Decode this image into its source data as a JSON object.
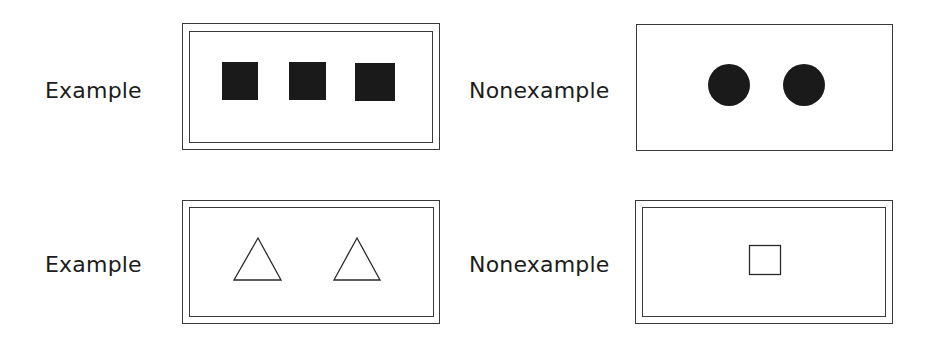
{
  "panels": [
    {
      "id": "top-left",
      "label": "Example",
      "frame_style": "double",
      "shapes": [
        {
          "kind": "filled-square",
          "count": 3,
          "color": "#1a1a1a"
        }
      ]
    },
    {
      "id": "top-right",
      "label": "Nonexample",
      "frame_style": "single",
      "shapes": [
        {
          "kind": "filled-circle",
          "count": 2,
          "color": "#1a1a1a"
        }
      ]
    },
    {
      "id": "bottom-left",
      "label": "Example",
      "frame_style": "double",
      "shapes": [
        {
          "kind": "outlined-triangle",
          "count": 2,
          "color": "#2a2a2a"
        }
      ]
    },
    {
      "id": "bottom-right",
      "label": "Nonexample",
      "frame_style": "double",
      "shapes": [
        {
          "kind": "outlined-square",
          "count": 1,
          "color": "#2a2a2a"
        }
      ]
    }
  ],
  "colors": {
    "ink": "#1a1a1a",
    "frame_line": "#3a3a3a",
    "background": "#ffffff"
  }
}
